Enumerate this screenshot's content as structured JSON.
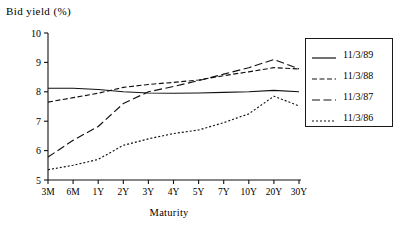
{
  "chart_data": {
    "type": "line",
    "title": "Bid yield (%)",
    "xlabel": "Maturity",
    "ylabel": "",
    "categories": [
      "3M",
      "6M",
      "1Y",
      "2Y",
      "3Y",
      "4Y",
      "5Y",
      "7Y",
      "10Y",
      "20Y",
      "30Y"
    ],
    "x_tick_labels": [
      "3M",
      "6M",
      "1Y",
      "2Y",
      "3Y",
      "4Y",
      "5Y",
      "7Y",
      "10Y",
      "20Y",
      "30Y"
    ],
    "y_tick_labels": [
      "5",
      "6",
      "7",
      "8",
      "9",
      "10"
    ],
    "y_ticks": [
      5,
      6,
      7,
      8,
      9,
      10
    ],
    "ylim": [
      5,
      10
    ],
    "grid": false,
    "legend_position": "right",
    "series": [
      {
        "name": "11/3/89",
        "style": "solid",
        "values": [
          8.12,
          8.12,
          8.08,
          8.0,
          7.96,
          7.95,
          7.96,
          7.98,
          8.0,
          8.05,
          8.0
        ]
      },
      {
        "name": "11/3/88",
        "style": "dashed",
        "values": [
          7.65,
          7.8,
          7.95,
          8.15,
          8.25,
          8.32,
          8.4,
          8.55,
          8.68,
          8.82,
          8.78
        ]
      },
      {
        "name": "11/3/87",
        "style": "long-dash",
        "values": [
          5.78,
          6.35,
          6.82,
          7.6,
          8.0,
          8.18,
          8.38,
          8.6,
          8.82,
          9.1,
          8.78
        ]
      },
      {
        "name": "11/3/86",
        "style": "dotted",
        "values": [
          5.35,
          5.5,
          5.7,
          6.18,
          6.4,
          6.58,
          6.7,
          6.95,
          7.25,
          7.85,
          7.52
        ]
      }
    ]
  },
  "legend": {
    "entries": [
      {
        "label": "11/3/89",
        "style": "solid"
      },
      {
        "label": "11/3/88",
        "style": "dashed"
      },
      {
        "label": "11/3/87",
        "style": "long-dash"
      },
      {
        "label": "11/3/86",
        "style": "dotted"
      }
    ]
  }
}
